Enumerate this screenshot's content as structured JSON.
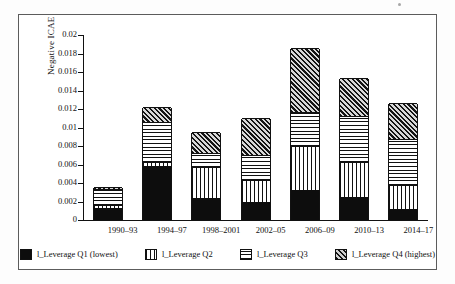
{
  "chart_data": {
    "type": "bar",
    "subtype": "stacked",
    "title": "",
    "xlabel": "",
    "ylabel": "Negative ICAE",
    "ylim": [
      0,
      0.02
    ],
    "ytick_values": [
      0,
      0.002,
      0.004,
      0.006,
      0.008,
      0.01,
      0.012,
      0.014,
      0.016,
      0.018,
      0.02
    ],
    "ytick_labels": [
      "0",
      "0.002",
      "0.004",
      "0.006",
      "0.008",
      "0.01",
      "0.012",
      "0.014",
      "0.016",
      "0.018",
      "0.02"
    ],
    "grid": false,
    "legend_position": "bottom",
    "categories": [
      "1990–93",
      "1994–97",
      "1998–2001",
      "2002–05",
      "2006–09",
      "2010–13",
      "2014–17"
    ],
    "series": [
      {
        "name": "l_Leverage Q1 (lowest)",
        "pattern": "solid-black",
        "values": [
          0.0013,
          0.0058,
          0.0024,
          0.002,
          0.0032,
          0.0025,
          0.0012
        ]
      },
      {
        "name": "l_Leverage Q2",
        "pattern": "vertical-lines",
        "values": [
          0.0003,
          0.0005,
          0.0033,
          0.0023,
          0.0048,
          0.0038,
          0.0026
        ]
      },
      {
        "name": "l_Leverage Q3",
        "pattern": "horizontal-lines",
        "values": [
          0.0018,
          0.0043,
          0.0015,
          0.0027,
          0.0037,
          0.0049,
          0.005
        ]
      },
      {
        "name": "l_Leverage Q4 (highest)",
        "pattern": "diagonal-hatch",
        "values": [
          0.0002,
          0.0016,
          0.0023,
          0.004,
          0.0069,
          0.0042,
          0.0038
        ]
      }
    ],
    "totals": [
      0.0036,
      0.0122,
      0.0095,
      0.011,
      0.0186,
      0.0154,
      0.0126
    ]
  },
  "legend": {
    "items": [
      {
        "label": "l_Leverage Q1 (lowest)",
        "swatch": "q1"
      },
      {
        "label": "l_Leverage Q2",
        "swatch": "q2"
      },
      {
        "label": "l_Leverage Q3",
        "swatch": "q3"
      },
      {
        "label": "l_Leverage Q4 (highest)",
        "swatch": "q4"
      }
    ]
  },
  "colors": {
    "ink": "#111111",
    "fill_black": "#0d0d0d",
    "hatch_light": "#d8d8d8",
    "frame": "#5c5c5c",
    "background": "#ffffff"
  }
}
